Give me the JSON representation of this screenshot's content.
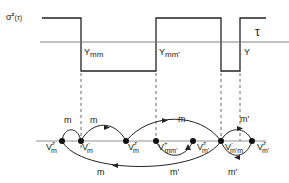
{
  "top_panel": {
    "signal_label": "σᶻ(τ)",
    "signal_label_base": "σ",
    "signal_label_sup": "z",
    "signal_label_arg": "(τ)",
    "axis_label": "τ",
    "interval_labels": [
      "Y",
      "mm",
      "Y",
      "mm'",
      "Y"
    ],
    "intervals": [
      {
        "label_base": "Y",
        "label_sub": "mm"
      },
      {
        "label_base": "Y",
        "label_sub": "mm'"
      },
      {
        "label_base": "Y",
        "label_sub": ""
      }
    ]
  },
  "bottom_panel": {
    "vertices": [
      {
        "base": "V",
        "sub": "m",
        "sup": "z"
      },
      {
        "base": "V",
        "sub": "m",
        "sup": "-"
      },
      {
        "base": "V",
        "sub": "m",
        "sup": "z"
      },
      {
        "base": "V",
        "sub": "mm'",
        "sup": "+"
      },
      {
        "base": "V",
        "sub": "m'",
        "sup": "z"
      },
      {
        "base": "V",
        "sub": "m'm",
        "sup": "-"
      },
      {
        "base": "V",
        "sub": "m'",
        "sup": "z"
      }
    ],
    "arc_labels": {
      "a1": "m",
      "a2": "m",
      "a3": "m",
      "a4": "m'",
      "a5": "m",
      "a6": "m'",
      "a7": "m'"
    }
  },
  "colors": {
    "line": "#222222",
    "axis": "#666666"
  }
}
